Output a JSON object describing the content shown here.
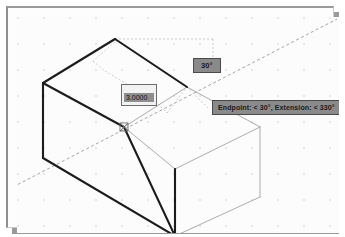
{
  "window": {
    "title": "AutoCAD Drawing Viewport",
    "background_color": "#fcfcfc",
    "frame_color": "#9b9b9b",
    "shadow_color": "#9a9a9a"
  },
  "viewport": {
    "grid": {
      "visible": true,
      "spacing_px": 26,
      "dot_color": "#c8b8b8"
    },
    "cursor": {
      "label": "aperture-crosshair",
      "x": 113,
      "y": 115
    }
  },
  "hud": {
    "angle_chip": {
      "label": "30°",
      "bg": "#8a8a8a",
      "fg": "#1a1a1a"
    },
    "snap_tooltip": {
      "label": "Endpoint: < 30°,  Extension: < 330°",
      "bg": "#8a8a8a",
      "fg": "#1a1a1a"
    },
    "distance_input": {
      "value": "3.0000",
      "placeholder": "Distance",
      "selected": true,
      "bg": "#f2f2f2",
      "highlight": "#8e8e8e"
    }
  },
  "geometry": {
    "solid_color": "#1c1c1c",
    "ghost_color": "#9a9a9a",
    "tracking_color": "#8d8d8d",
    "solid_edges": [
      {
        "name": "roof-apex-to-left",
        "x1": 104,
        "y1": 28,
        "x2": 32,
        "y2": 72
      },
      {
        "name": "roof-apex-to-right",
        "x1": 104,
        "y1": 28,
        "x2": 176,
        "y2": 75
      },
      {
        "name": "left-vertical",
        "x1": 32,
        "y1": 72,
        "x2": 32,
        "y2": 147
      },
      {
        "name": "bottom-left-slope",
        "x1": 32,
        "y1": 147,
        "x2": 163,
        "y2": 226
      },
      {
        "name": "front-vertical",
        "x1": 163,
        "y1": 226,
        "x2": 163,
        "y2": 158
      },
      {
        "name": "ridge-to-front",
        "x1": 113,
        "y1": 115,
        "x2": 163,
        "y2": 226
      },
      {
        "name": "ridge-to-left",
        "x1": 113,
        "y1": 115,
        "x2": 32,
        "y2": 72
      }
    ],
    "ghost_edges": [
      {
        "name": "ghost-top-right-a",
        "x1": 176,
        "y1": 75,
        "x2": 248,
        "y2": 114
      },
      {
        "name": "ghost-top-right-b",
        "x1": 248,
        "y1": 114,
        "x2": 248,
        "y2": 185
      },
      {
        "name": "ghost-right-lower",
        "x1": 248,
        "y1": 185,
        "x2": 163,
        "y2": 226
      },
      {
        "name": "ghost-ridge-right",
        "x1": 113,
        "y1": 115,
        "x2": 176,
        "y2": 75
      },
      {
        "name": "ghost-ridge-down",
        "x1": 113,
        "y1": 115,
        "x2": 163,
        "y2": 158
      },
      {
        "name": "ghost-front-face",
        "x1": 163,
        "y1": 158,
        "x2": 248,
        "y2": 114
      },
      {
        "name": "ghost-front-vert",
        "x1": 163,
        "y1": 158,
        "x2": 163,
        "y2": 226
      }
    ],
    "tracking_lines": [
      {
        "name": "polar-tracking-30deg",
        "x1": 2,
        "y1": 176,
        "x2": 320,
        "y2": 9
      },
      {
        "name": "dim-witness-top",
        "x1": 104,
        "y1": 28,
        "x2": 196,
        "y2": 28
      },
      {
        "name": "dim-witness-drop",
        "x1": 196,
        "y1": 28,
        "x2": 196,
        "y2": 48
      },
      {
        "name": "leader-roof-a",
        "x1": 104,
        "y1": 31,
        "x2": 83,
        "y2": 48
      },
      {
        "name": "leader-roof-b",
        "x1": 83,
        "y1": 48,
        "x2": 95,
        "y2": 58
      },
      {
        "name": "leader-roof-c",
        "x1": 95,
        "y1": 58,
        "x2": 142,
        "y2": 86
      },
      {
        "name": "leader-roof-d",
        "x1": 142,
        "y1": 86,
        "x2": 156,
        "y2": 98
      },
      {
        "name": "leader-roof-e",
        "x1": 156,
        "y1": 98,
        "x2": 176,
        "y2": 75
      },
      {
        "name": "tooltip-leader",
        "x1": 176,
        "y1": 75,
        "x2": 196,
        "y2": 95
      }
    ]
  }
}
